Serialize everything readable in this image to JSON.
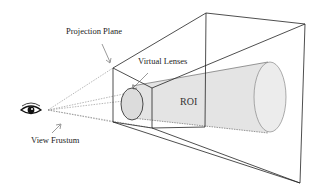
{
  "diagram": {
    "labels": {
      "projection_plane": "Projection Plane",
      "virtual_lenses": "Virtual Lenses",
      "roi": "ROI",
      "view_frustum": "View Frustum"
    },
    "icons": {
      "eye": "eye-icon"
    },
    "colors": {
      "line": "#222222",
      "dotted": "#777777",
      "roi_fill": "#e2e2e2",
      "lens_fill": "#dcdcdc",
      "background": "#ffffff"
    }
  }
}
